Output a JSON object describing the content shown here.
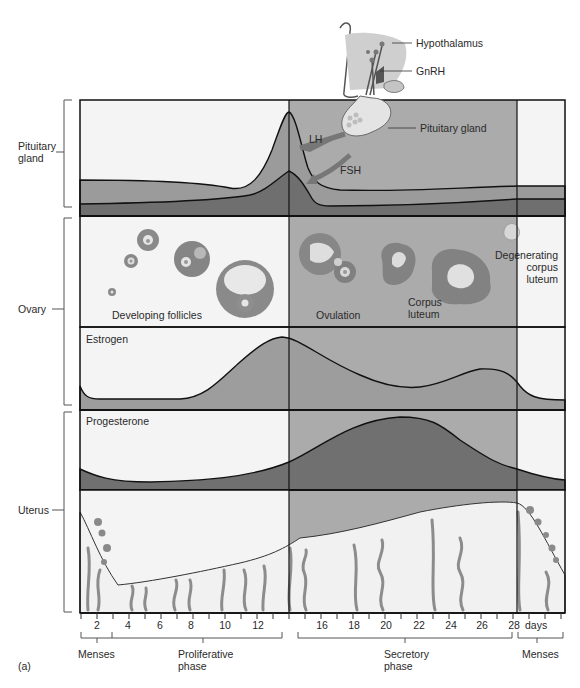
{
  "figure_label": "(a)",
  "colors": {
    "background": "#ffffff",
    "panel_light": "#f3f3f3",
    "secretory_shade": "#a9a9a9",
    "curve_fill_light": "#9d9d9d",
    "curve_fill_dark": "#6f6f6f",
    "line": "#111111",
    "gland_fill": "#c9c9c9",
    "tissue": "#8a8a8a"
  },
  "top_illustration": {
    "hypothalamus_label": "Hypothalamus",
    "gnrh_label": "GnRH",
    "pituitary_label": "Pituitary gland",
    "lh_label": "LH",
    "fsh_label": "FSH"
  },
  "rows": {
    "pituitary": {
      "label_line1": "Pituitary",
      "label_line2": "gland"
    },
    "ovary": {
      "label": "Ovary"
    },
    "uterus": {
      "label": "Uterus"
    }
  },
  "ovary_panel": {
    "developing_label": "Developing follicles",
    "ovulation_label": "Ovulation",
    "corpus_luteum_line1": "Corpus",
    "corpus_luteum_line2": "luteum",
    "degenerating_line1": "Degenerating",
    "degenerating_line2": "corpus",
    "degenerating_line3": "luteum"
  },
  "hormone_panels": {
    "estrogen_label": "Estrogen",
    "progesterone_label": "Progesterone"
  },
  "axis": {
    "ticks": [
      "2",
      "4",
      "6",
      "8",
      "10",
      "12",
      "16",
      "18",
      "20",
      "22",
      "24",
      "26",
      "28"
    ],
    "unit": "days"
  },
  "phases": {
    "menses_start": "Menses",
    "proliferative_line1": "Proliferative",
    "proliferative_line2": "phase",
    "secretory_line1": "Secretory",
    "secretory_line2": "phase",
    "menses_end": "Menses"
  }
}
